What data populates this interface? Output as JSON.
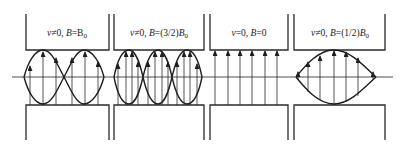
{
  "figure": {
    "colors": {
      "line": "#2a2a2a",
      "background": "#ffffff"
    },
    "axis_y": 77,
    "panels": [
      {
        "id": "p1",
        "label": {
          "v": "v",
          "cond_v": "≠0, ",
          "B": "B",
          "cond_B": "=B",
          "sub": "0",
          "full": "v≠0, B=B0"
        },
        "x0": 26,
        "x1": 109,
        "envelope_lobes": 2,
        "lobe_bounds": [
          [
            24,
            64
          ],
          [
            64,
            104
          ]
        ],
        "arrows_x": [
          30,
          43,
          56,
          72,
          85,
          98
        ]
      },
      {
        "id": "p2",
        "label": {
          "v": "v",
          "cond_v": "≠0, ",
          "B": "B",
          "cond_B": "=(3/2)",
          "B2": "B",
          "sub": "0",
          "full": "v≠0, B=(3/2)B0"
        },
        "x0": 114,
        "x1": 204,
        "envelope_lobes": 3,
        "lobe_bounds": [
          [
            114,
            143
          ],
          [
            143,
            172
          ],
          [
            172,
            202
          ]
        ],
        "arrows_x": [
          118,
          126,
          132,
          138,
          148,
          155,
          162,
          168,
          177,
          184,
          190,
          197
        ]
      },
      {
        "id": "p3",
        "label": {
          "v": "v",
          "cond_v": "=0, ",
          "B": "B",
          "cond_B": "=0",
          "full": "v=0, B=0"
        },
        "x0": 210,
        "x1": 288,
        "envelope_lobes": 0,
        "arrows_x": [
          215,
          228,
          240,
          252,
          265,
          277
        ]
      },
      {
        "id": "p4",
        "label": {
          "v": "v",
          "cond_v": "≠0, ",
          "B": "B",
          "cond_B": "=(1/2)",
          "B2": "B",
          "sub": "0",
          "full": "v≠0, B=(1/2)B0"
        },
        "x0": 294,
        "x1": 385,
        "envelope_lobes": 1,
        "lobe_bounds": [
          [
            296,
            376
          ]
        ],
        "arrows_x": [
          298,
          308,
          320,
          334,
          346,
          358,
          373
        ]
      }
    ]
  }
}
